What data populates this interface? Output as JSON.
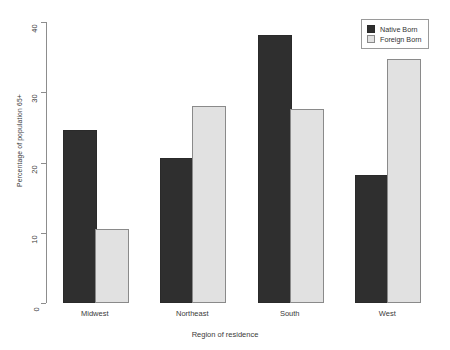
{
  "chart_data": {
    "type": "bar",
    "title": "",
    "subtitle": "",
    "xlabel": "Region of residence",
    "ylabel": "Percentage of population 65+",
    "categories": [
      "Midwest",
      "Northeast",
      "South",
      "West"
    ],
    "series": [
      {
        "name": "Native Born",
        "color": "#2f2f2f",
        "values": [
          24.3,
          20.4,
          37.8,
          18.0
        ]
      },
      {
        "name": "Foreign Born",
        "color": "#e1e1e1",
        "values": [
          10.2,
          27.7,
          27.4,
          34.5
        ]
      }
    ],
    "ylim": [
      0,
      40
    ],
    "yticks": [
      0,
      10,
      20,
      30,
      40
    ],
    "ytick_labels": [
      "0",
      "10",
      "20",
      "30",
      "40"
    ],
    "grid": false,
    "legend_position": "top-right",
    "bar_style": {
      "native_fill": "#2f2f2f",
      "native_border": "#2a2a2a",
      "foreign_fill": "#e1e1e1",
      "foreign_border": "#8a8a8a"
    },
    "axis_color": "#8d8d8d"
  },
  "legend": {
    "entries": [
      {
        "label": "Native Born",
        "swatch": "filled-dark-square"
      },
      {
        "label": "Foreign Born",
        "swatch": "outlined-light-square"
      }
    ]
  },
  "page": {
    "artifact_text": ""
  }
}
